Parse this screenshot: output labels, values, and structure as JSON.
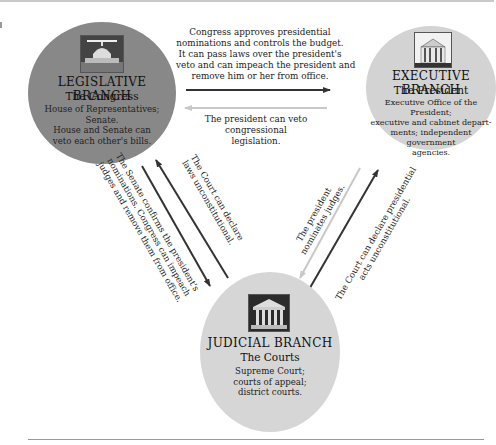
{
  "diagram": {
    "type": "checks-and-balances",
    "nodes": {
      "legislative": {
        "title": "LEGISLATIVE BRANCH",
        "subtitle": "The Congress",
        "description": [
          "House of Representatives;",
          "Senate.",
          "House and Senate can",
          "veto each other's bills."
        ],
        "icon": "capitol-building-photo",
        "color": "#888888"
      },
      "executive": {
        "title": "EXECUTIVE BRANCH",
        "subtitle": "The President",
        "description": [
          "Executive Office of the President;",
          "executive and cabinet depart-",
          "ments; independent",
          "government",
          "agencies."
        ],
        "icon": "white-house-photo",
        "color": "#d3d3d3"
      },
      "judicial": {
        "title": "JUDICIAL BRANCH",
        "subtitle": "The Courts",
        "description": [
          "Supreme Court;",
          "courts of appeal;",
          "district courts."
        ],
        "icon": "supreme-court-photo",
        "color": "#d6d6d6"
      }
    },
    "edges": {
      "leg_to_exe": {
        "from": "legislative",
        "to": "executive",
        "color": "#333333",
        "label": [
          "Congress approves presidential",
          "nominations and controls the budget.",
          "It can pass laws over the president's",
          "veto and can impeach the president and",
          "remove him or her from office."
        ]
      },
      "exe_to_leg": {
        "from": "executive",
        "to": "legislative",
        "color": "#c8c8c8",
        "label": [
          "The president can veto",
          "congressional",
          "legislation."
        ]
      },
      "leg_to_jud": {
        "from": "legislative",
        "to": "judicial",
        "color": "#333333",
        "label": [
          "The Senate confirms the president's",
          "nominations. Congress can impeach",
          "judges and remove them from office."
        ]
      },
      "jud_to_leg": {
        "from": "judicial",
        "to": "legislative",
        "color": "#333333",
        "label": [
          "The Court can declare",
          "laws unconstitutional."
        ]
      },
      "exe_to_jud": {
        "from": "executive",
        "to": "judicial",
        "color": "#c8c8c8",
        "label": [
          "The president",
          "nominates judges."
        ]
      },
      "jud_to_exe": {
        "from": "judicial",
        "to": "executive",
        "color": "#333333",
        "label": [
          "The Court can declare presidential",
          "acts unconstitutional."
        ]
      }
    }
  }
}
